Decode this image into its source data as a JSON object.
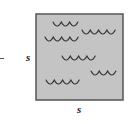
{
  "diagram": {
    "colors": {
      "fill": "#c4c4c4",
      "border": "#555555",
      "wave": "#333333",
      "label": "#222222"
    },
    "square": {
      "x": 36,
      "y": 14,
      "width": 87,
      "height": 86
    },
    "labels": {
      "left_side": "s",
      "bottom_side": "s"
    },
    "left_mark": "–",
    "wave_rows": [
      {
        "x": 53,
        "y": 26,
        "arcs": 3
      },
      {
        "x": 82,
        "y": 34,
        "arcs": 4
      },
      {
        "x": 45,
        "y": 41,
        "arcs": 4
      },
      {
        "x": 62,
        "y": 60,
        "arcs": 4
      },
      {
        "x": 91,
        "y": 75,
        "arcs": 3
      },
      {
        "x": 46,
        "y": 84,
        "arcs": 4
      }
    ],
    "arc_width": 8.3,
    "arc_depth": 4,
    "icon": "water-waves-icon"
  }
}
